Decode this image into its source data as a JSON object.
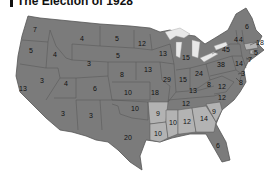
{
  "title": "The Election of 1928",
  "colors": {
    "republican_fill": "#7b7b7b",
    "democratic_fill": "#b3b3b3",
    "border": "#555555",
    "lakes": "#e8e8e8",
    "label": "#111111"
  },
  "states": [
    {
      "name": "Washington",
      "votes": "7",
      "party": "R",
      "x": 35,
      "y": 29
    },
    {
      "name": "Oregon",
      "votes": "5",
      "party": "R",
      "x": 31,
      "y": 50
    },
    {
      "name": "California",
      "votes": "13",
      "party": "R",
      "x": 23,
      "y": 88
    },
    {
      "name": "Idaho",
      "votes": "4",
      "party": "R",
      "x": 55,
      "y": 54
    },
    {
      "name": "Nevada",
      "votes": "3",
      "party": "R",
      "x": 42,
      "y": 80
    },
    {
      "name": "Montana",
      "votes": "4",
      "party": "R",
      "x": 82,
      "y": 38
    },
    {
      "name": "Wyoming",
      "votes": "3",
      "party": "R",
      "x": 89,
      "y": 63
    },
    {
      "name": "Utah",
      "votes": "4",
      "party": "R",
      "x": 66,
      "y": 83
    },
    {
      "name": "Arizona",
      "votes": "3",
      "party": "R",
      "x": 63,
      "y": 113
    },
    {
      "name": "Colorado",
      "votes": "6",
      "party": "R",
      "x": 95,
      "y": 88
    },
    {
      "name": "New Mexico",
      "votes": "3",
      "party": "R",
      "x": 91,
      "y": 115
    },
    {
      "name": "North Dakota",
      "votes": "5",
      "party": "R",
      "x": 117,
      "y": 38
    },
    {
      "name": "South Dakota",
      "votes": "5",
      "party": "R",
      "x": 118,
      "y": 55
    },
    {
      "name": "Nebraska",
      "votes": "8",
      "party": "R",
      "x": 122,
      "y": 74
    },
    {
      "name": "Kansas",
      "votes": "10",
      "party": "R",
      "x": 128,
      "y": 92
    },
    {
      "name": "Oklahoma",
      "votes": "10",
      "party": "R",
      "x": 135,
      "y": 108
    },
    {
      "name": "Texas",
      "votes": "20",
      "party": "R",
      "x": 128,
      "y": 137
    },
    {
      "name": "Minnesota",
      "votes": "12",
      "party": "R",
      "x": 142,
      "y": 43
    },
    {
      "name": "Iowa",
      "votes": "13",
      "party": "R",
      "x": 148,
      "y": 69
    },
    {
      "name": "Missouri",
      "votes": "18",
      "party": "R",
      "x": 155,
      "y": 92
    },
    {
      "name": "Arkansas",
      "votes": "9",
      "party": "D",
      "x": 158,
      "y": 113
    },
    {
      "name": "Louisiana",
      "votes": "10",
      "party": "D",
      "x": 158,
      "y": 133
    },
    {
      "name": "Wisconsin",
      "votes": "13",
      "party": "R",
      "x": 163,
      "y": 53
    },
    {
      "name": "Illinois",
      "votes": "29",
      "party": "R",
      "x": 167,
      "y": 79
    },
    {
      "name": "Michigan",
      "votes": "15",
      "party": "R",
      "x": 186,
      "y": 57
    },
    {
      "name": "Indiana",
      "votes": "15",
      "party": "R",
      "x": 183,
      "y": 79
    },
    {
      "name": "Ohio",
      "votes": "24",
      "party": "R",
      "x": 199,
      "y": 73
    },
    {
      "name": "Kentucky",
      "votes": "13",
      "party": "R",
      "x": 193,
      "y": 90
    },
    {
      "name": "Tennessee",
      "votes": "12",
      "party": "R",
      "x": 186,
      "y": 103
    },
    {
      "name": "Mississippi",
      "votes": "10",
      "party": "D",
      "x": 173,
      "y": 122
    },
    {
      "name": "Alabama",
      "votes": "12",
      "party": "D",
      "x": 187,
      "y": 121
    },
    {
      "name": "Georgia",
      "votes": "14",
      "party": "D",
      "x": 204,
      "y": 118
    },
    {
      "name": "Florida",
      "votes": "6",
      "party": "R",
      "x": 218,
      "y": 145
    },
    {
      "name": "South Carolina",
      "votes": "9",
      "party": "D",
      "x": 214,
      "y": 111
    },
    {
      "name": "North Carolina",
      "votes": "12",
      "party": "R",
      "x": 222,
      "y": 97
    },
    {
      "name": "Virginia",
      "votes": "12",
      "party": "R",
      "x": 222,
      "y": 86
    },
    {
      "name": "West Virginia",
      "votes": "8",
      "party": "R",
      "x": 209,
      "y": 84
    },
    {
      "name": "Pennsylvania",
      "votes": "38",
      "party": "R",
      "x": 221,
      "y": 64
    },
    {
      "name": "New York",
      "votes": "45",
      "party": "R",
      "x": 226,
      "y": 49
    },
    {
      "name": "Maine",
      "votes": "6",
      "party": "R",
      "x": 247,
      "y": 26
    },
    {
      "name": "New Hampshire",
      "votes": "4",
      "party": "R",
      "x": 241,
      "y": 39
    },
    {
      "name": "Vermont",
      "votes": "4",
      "party": "R",
      "x": 236,
      "y": 39
    },
    {
      "name": "Massachusetts",
      "votes": "18",
      "party": "D",
      "x": 260,
      "y": 42
    },
    {
      "name": "Rhode Island",
      "votes": "5",
      "party": "D",
      "x": 256,
      "y": 52
    },
    {
      "name": "Connecticut",
      "votes": "7",
      "party": "R",
      "x": 250,
      "y": 59
    },
    {
      "name": "New Jersey",
      "votes": "14",
      "party": "R",
      "x": 239,
      "y": 63
    },
    {
      "name": "Delaware",
      "votes": "3",
      "party": "R",
      "x": 243,
      "y": 73
    },
    {
      "name": "Maryland",
      "votes": "8",
      "party": "R",
      "x": 241,
      "y": 82
    }
  ]
}
